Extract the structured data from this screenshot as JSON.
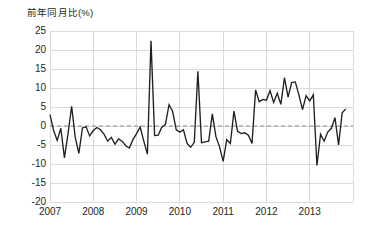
{
  "chart_data": {
    "type": "line",
    "title": "前年同月比(%)",
    "xlabel": "",
    "ylabel": "前年同月比(%)",
    "ylim": [
      -20,
      25
    ],
    "xlim": [
      "2007-01",
      "2013-12"
    ],
    "ytick_labels": [
      "25",
      "20",
      "15",
      "10",
      "5",
      "0",
      "-5",
      "-10",
      "-15",
      "-20"
    ],
    "ytick_values": [
      25,
      20,
      15,
      10,
      5,
      0,
      -5,
      -10,
      -15,
      -20
    ],
    "xtick_labels": [
      "2007",
      "2008",
      "2009",
      "2010",
      "2011",
      "2012",
      "2013"
    ],
    "xtick_values": [
      2007,
      2008,
      2009,
      2010,
      2011,
      2012,
      2013
    ],
    "grid": true,
    "legend": "none",
    "zero_reference_line": 0,
    "zero_line_style": "dashed",
    "line_color": "#231f20",
    "grid_color": "#cccccc",
    "zero_line_color": "#8c8c8c",
    "series": [
      {
        "name": "前年同月比",
        "x": [
          "2007-01",
          "2007-02",
          "2007-03",
          "2007-04",
          "2007-05",
          "2007-06",
          "2007-07",
          "2007-08",
          "2007-09",
          "2007-10",
          "2007-11",
          "2007-12",
          "2008-01",
          "2008-02",
          "2008-03",
          "2008-04",
          "2008-05",
          "2008-06",
          "2008-07",
          "2008-08",
          "2008-09",
          "2008-10",
          "2008-11",
          "2008-12",
          "2009-01",
          "2009-02",
          "2009-03",
          "2009-04",
          "2009-05",
          "2009-06",
          "2009-07",
          "2009-08",
          "2009-09",
          "2009-10",
          "2009-11",
          "2009-12",
          "2010-01",
          "2010-02",
          "2010-03",
          "2010-04",
          "2010-05",
          "2010-06",
          "2010-07",
          "2010-08",
          "2010-09",
          "2010-10",
          "2010-11",
          "2010-12",
          "2011-01",
          "2011-02",
          "2011-03",
          "2011-04",
          "2011-05",
          "2011-06",
          "2011-07",
          "2011-08",
          "2011-09",
          "2011-10",
          "2011-11",
          "2011-12",
          "2012-01",
          "2012-02",
          "2012-03",
          "2012-04",
          "2012-05",
          "2012-06",
          "2012-07",
          "2012-08",
          "2012-09",
          "2012-10",
          "2012-11",
          "2012-12",
          "2013-01",
          "2013-02",
          "2013-03",
          "2013-04",
          "2013-05",
          "2013-06",
          "2013-07",
          "2013-08",
          "2013-09",
          "2013-10",
          "2013-11"
        ],
        "values": [
          3.0,
          -1.2,
          -3.8,
          -0.6,
          -8.4,
          -2.0,
          5.2,
          -3.0,
          -7.2,
          -0.5,
          -0.2,
          -2.6,
          -1.2,
          -0.4,
          -1.0,
          -2.2,
          -4.0,
          -3.0,
          -4.8,
          -3.4,
          -4.0,
          -5.2,
          -5.8,
          -3.6,
          -2.0,
          -0.3,
          -4.0,
          -7.4,
          22.4,
          -2.5,
          -2.4,
          -0.3,
          0.4,
          5.6,
          3.8,
          -1.0,
          -1.6,
          -1.0,
          -4.6,
          -5.6,
          -4.3,
          14.4,
          -4.4,
          -4.2,
          -4.0,
          3.2,
          -2.8,
          -5.5,
          -9.3,
          -3.6,
          -4.6,
          3.9,
          -1.4,
          -2.0,
          -1.8,
          -2.4,
          -4.6,
          9.5,
          6.4,
          7.0,
          6.8,
          9.3,
          6.2,
          8.6,
          5.7,
          12.7,
          7.6,
          11.4,
          11.6,
          8.2,
          4.3,
          8.0,
          6.6,
          8.2,
          -10.4,
          -2.2,
          -4.0,
          -1.6,
          -0.6,
          2.2,
          -5.0,
          3.5,
          4.5
        ]
      }
    ]
  },
  "axes": {
    "ytick_labels": [
      "25",
      "20",
      "15",
      "10",
      "5",
      "0",
      "-5",
      "-10",
      "-15",
      "-20"
    ],
    "xtick_labels": [
      "2007",
      "2008",
      "2009",
      "2010",
      "2011",
      "2012",
      "2013"
    ]
  }
}
